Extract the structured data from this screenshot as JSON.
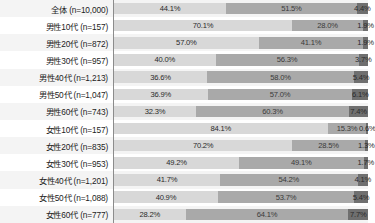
{
  "chart_data": {
    "type": "bar",
    "subtype": "100% stacked horizontal bar",
    "title": "",
    "xlabel": "",
    "ylabel": "",
    "xlim": [
      0,
      100
    ],
    "grid": false,
    "legend": "none",
    "value_suffix": "%",
    "colors": {
      "segment1": "#d8d8d8",
      "segment2": "#a9a9a9",
      "segment3": "#6f6f6f",
      "axis_line": "#8c8c8c",
      "row_alt_background": "#f4f4f4",
      "text": "#1c1c1c"
    },
    "categories": [
      "全体 (n=10,000)",
      "男性10代 (n=157)",
      "男性20代 (n=872)",
      "男性30代 (n=957)",
      "男性40代 (n=1,213)",
      "男性50代 (n=1,047)",
      "男性60代 (n=743)",
      "女性10代 (n=157)",
      "女性20代 (n=835)",
      "女性30代 (n=953)",
      "女性40代 (n=1,201)",
      "女性50代 (n=1,088)",
      "女性60代 (n=777)"
    ],
    "series": [
      {
        "name": "segment1",
        "values": [
          44.1,
          70.1,
          57.0,
          40.0,
          36.6,
          36.9,
          32.3,
          84.1,
          70.2,
          49.2,
          41.7,
          40.9,
          28.2
        ]
      },
      {
        "name": "segment2",
        "values": [
          51.5,
          28.0,
          41.1,
          56.3,
          58.0,
          57.0,
          60.3,
          15.3,
          28.5,
          49.1,
          54.2,
          53.7,
          64.1
        ]
      },
      {
        "name": "segment3",
        "values": [
          4.4,
          1.9,
          1.9,
          3.7,
          5.4,
          6.1,
          7.4,
          0.6,
          1.3,
          1.7,
          4.1,
          5.4,
          7.7
        ]
      }
    ],
    "rows": [
      {
        "label": "全体 (n=10,000)",
        "v1": "44.1%",
        "v2": "51.5%",
        "v3": "4.4%",
        "p1": 44.1,
        "p2": 51.5,
        "p3": 4.4
      },
      {
        "label": "男性10代 (n=157)",
        "v1": "70.1%",
        "v2": "28.0%",
        "v3": "1.9%",
        "p1": 70.1,
        "p2": 28.0,
        "p3": 1.9
      },
      {
        "label": "男性20代 (n=872)",
        "v1": "57.0%",
        "v2": "41.1%",
        "v3": "1.9%",
        "p1": 57.0,
        "p2": 41.1,
        "p3": 1.9
      },
      {
        "label": "男性30代 (n=957)",
        "v1": "40.0%",
        "v2": "56.3%",
        "v3": "3.7%",
        "p1": 40.0,
        "p2": 56.3,
        "p3": 3.7
      },
      {
        "label": "男性40代 (n=1,213)",
        "v1": "36.6%",
        "v2": "58.0%",
        "v3": "5.4%",
        "p1": 36.6,
        "p2": 58.0,
        "p3": 5.4
      },
      {
        "label": "男性50代 (n=1,047)",
        "v1": "36.9%",
        "v2": "57.0%",
        "v3": "6.1%",
        "p1": 36.9,
        "p2": 57.0,
        "p3": 6.1
      },
      {
        "label": "男性60代 (n=743)",
        "v1": "32.3%",
        "v2": "60.3%",
        "v3": "7.4%",
        "p1": 32.3,
        "p2": 60.3,
        "p3": 7.4
      },
      {
        "label": "女性10代 (n=157)",
        "v1": "84.1%",
        "v2": "15.3%",
        "v3": "0.6%",
        "p1": 84.1,
        "p2": 15.3,
        "p3": 0.6
      },
      {
        "label": "女性20代 (n=835)",
        "v1": "70.2%",
        "v2": "28.5%",
        "v3": "1.3%",
        "p1": 70.2,
        "p2": 28.5,
        "p3": 1.3
      },
      {
        "label": "女性30代 (n=953)",
        "v1": "49.2%",
        "v2": "49.1%",
        "v3": "1.7%",
        "p1": 49.2,
        "p2": 49.1,
        "p3": 1.7
      },
      {
        "label": "女性40代 (n=1,201)",
        "v1": "41.7%",
        "v2": "54.2%",
        "v3": "4.1%",
        "p1": 41.7,
        "p2": 54.2,
        "p3": 4.1
      },
      {
        "label": "女性50代 (n=1,088)",
        "v1": "40.9%",
        "v2": "53.7%",
        "v3": "5.4%",
        "p1": 40.9,
        "p2": 53.7,
        "p3": 5.4
      },
      {
        "label": "女性60代 (n=777)",
        "v1": "28.2%",
        "v2": "64.1%",
        "v3": "7.7%",
        "p1": 28.2,
        "p2": 64.1,
        "p3": 7.7
      }
    ]
  }
}
